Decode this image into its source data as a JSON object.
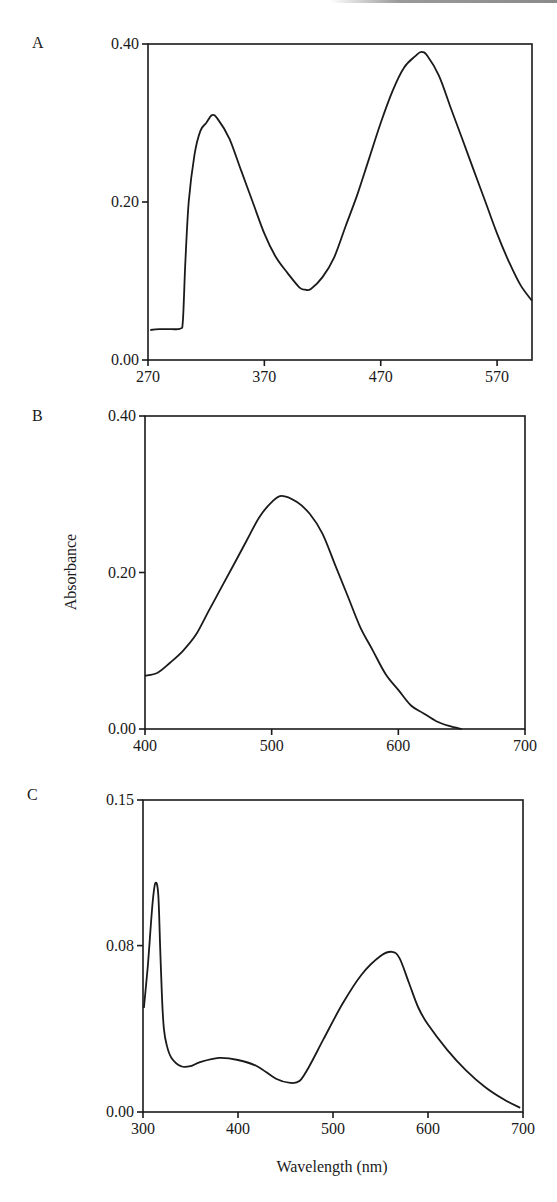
{
  "figure": {
    "shared_ylabel": "Absorbance",
    "shared_xlabel": "Wavelength (nm)"
  },
  "chart_data": [
    {
      "type": "line",
      "panel": "A",
      "title": "",
      "xlabel": "",
      "ylabel": "Absorbance",
      "xlim": [
        270,
        600
      ],
      "ylim": [
        0.0,
        0.4
      ],
      "xticks": [
        "270",
        "370",
        "470",
        "570"
      ],
      "yticks": [
        "0.00",
        "0.20",
        "0.40"
      ],
      "grid": false,
      "series": [
        {
          "name": "A",
          "x": [
            272,
            280,
            290,
            298,
            300,
            302,
            305,
            310,
            315,
            320,
            325,
            330,
            340,
            350,
            360,
            370,
            380,
            390,
            400,
            405,
            410,
            420,
            430,
            440,
            450,
            460,
            470,
            480,
            490,
            500,
            505,
            510,
            520,
            530,
            540,
            550,
            560,
            570,
            580,
            590,
            600
          ],
          "y": [
            0.038,
            0.039,
            0.039,
            0.04,
            0.05,
            0.12,
            0.2,
            0.26,
            0.29,
            0.3,
            0.31,
            0.305,
            0.28,
            0.24,
            0.2,
            0.16,
            0.13,
            0.11,
            0.092,
            0.089,
            0.09,
            0.105,
            0.13,
            0.17,
            0.21,
            0.255,
            0.3,
            0.34,
            0.37,
            0.385,
            0.39,
            0.385,
            0.36,
            0.32,
            0.28,
            0.24,
            0.2,
            0.16,
            0.125,
            0.095,
            0.075
          ]
        }
      ]
    },
    {
      "type": "line",
      "panel": "B",
      "title": "",
      "xlabel": "",
      "ylabel": "Absorbance",
      "xlim": [
        400,
        700
      ],
      "ylim": [
        0.0,
        0.4
      ],
      "xticks": [
        "400",
        "500",
        "600",
        "700"
      ],
      "yticks": [
        "0.00",
        "0.20",
        "0.40"
      ],
      "grid": false,
      "series": [
        {
          "name": "B",
          "x": [
            400,
            410,
            420,
            430,
            440,
            450,
            460,
            470,
            480,
            490,
            500,
            508,
            520,
            530,
            540,
            550,
            560,
            570,
            580,
            590,
            600,
            610,
            620,
            630,
            640,
            650
          ],
          "y": [
            0.068,
            0.072,
            0.085,
            0.1,
            0.12,
            0.15,
            0.18,
            0.21,
            0.24,
            0.27,
            0.29,
            0.298,
            0.29,
            0.275,
            0.25,
            0.21,
            0.17,
            0.13,
            0.1,
            0.07,
            0.05,
            0.03,
            0.02,
            0.01,
            0.004,
            0.0
          ]
        }
      ]
    },
    {
      "type": "line",
      "panel": "C",
      "title": "",
      "xlabel": "Wavelength (nm)",
      "ylabel": "",
      "xlim": [
        300,
        700
      ],
      "ylim": [
        0.0,
        0.15
      ],
      "xticks": [
        "300",
        "400",
        "500",
        "600",
        "700"
      ],
      "yticks": [
        "0.00",
        "0.08",
        "0.15"
      ],
      "grid": false,
      "series": [
        {
          "name": "C",
          "x": [
            301,
            305,
            310,
            313,
            316,
            318,
            320,
            322,
            325,
            330,
            340,
            350,
            360,
            380,
            400,
            420,
            440,
            455,
            465,
            475,
            490,
            510,
            530,
            550,
            562,
            570,
            580,
            590,
            600,
            620,
            640,
            660,
            680,
            697
          ],
          "y": [
            0.05,
            0.07,
            0.1,
            0.11,
            0.105,
            0.08,
            0.055,
            0.04,
            0.032,
            0.026,
            0.022,
            0.022,
            0.024,
            0.026,
            0.025,
            0.022,
            0.016,
            0.014,
            0.015,
            0.022,
            0.035,
            0.052,
            0.066,
            0.075,
            0.077,
            0.074,
            0.062,
            0.05,
            0.042,
            0.03,
            0.02,
            0.012,
            0.006,
            0.002
          ]
        }
      ]
    }
  ]
}
